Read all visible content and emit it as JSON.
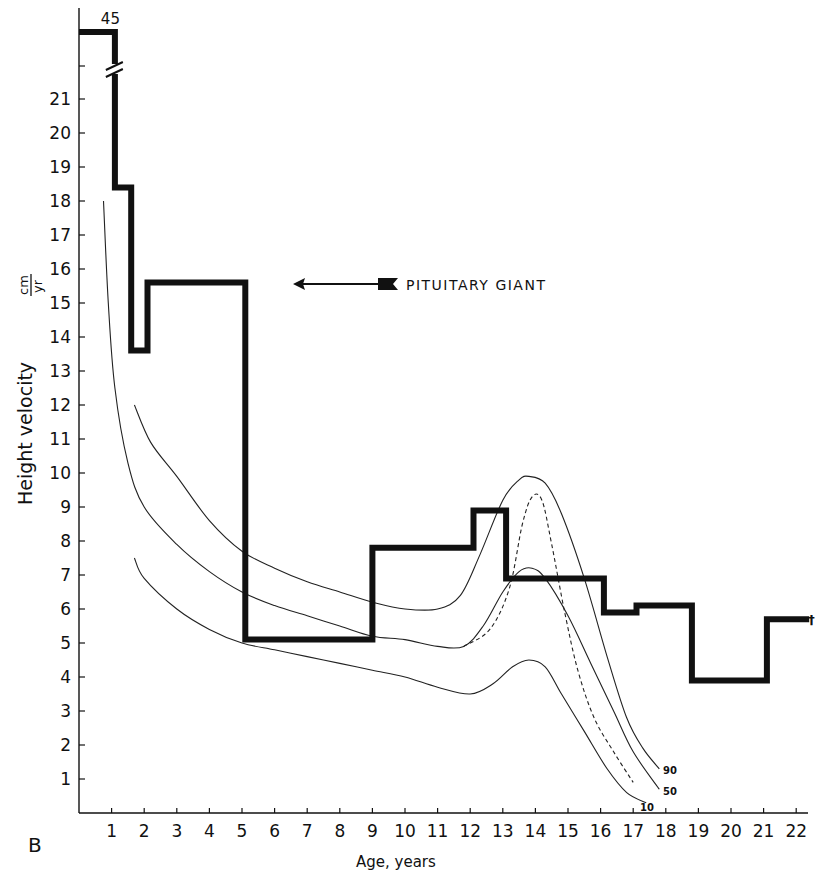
{
  "chart_data": {
    "type": "line",
    "title": "",
    "panel_label": "B",
    "xlabel": "Age, years",
    "ylabel": "Height velocity",
    "ylabel_unit": "cm/yr",
    "xlim": [
      0,
      22.7
    ],
    "ylim": [
      0,
      22
    ],
    "x_ticks": [
      1,
      2,
      3,
      4,
      5,
      6,
      7,
      8,
      9,
      10,
      11,
      12,
      13,
      14,
      15,
      16,
      17,
      18,
      19,
      20,
      21,
      22
    ],
    "y_ticks": [
      1,
      2,
      3,
      4,
      5,
      6,
      7,
      8,
      9,
      10,
      11,
      12,
      13,
      14,
      15,
      16,
      17,
      18,
      19,
      20,
      21
    ],
    "axis_break": {
      "label": "45",
      "value": 45,
      "note": "y-axis break; first interval off-scale at 45 cm/yr"
    },
    "grid": false,
    "legend": {
      "entries": [
        "PITUITARY GIANT"
      ],
      "position": "upper-center, arrow pointing left"
    },
    "series": [
      {
        "name": "PITUITARY GIANT",
        "style": "thick step",
        "steps": [
          {
            "from": 0.0,
            "to": 1.1,
            "value": 45
          },
          {
            "from": 1.1,
            "to": 1.6,
            "value": 18.4
          },
          {
            "from": 1.6,
            "to": 2.1,
            "value": 13.6
          },
          {
            "from": 2.1,
            "to": 5.1,
            "value": 15.6
          },
          {
            "from": 5.1,
            "to": 9.0,
            "value": 5.1
          },
          {
            "from": 9.0,
            "to": 12.1,
            "value": 7.8
          },
          {
            "from": 12.1,
            "to": 13.1,
            "value": 8.9
          },
          {
            "from": 13.1,
            "to": 16.1,
            "value": 6.9
          },
          {
            "from": 16.1,
            "to": 17.1,
            "value": 5.9
          },
          {
            "from": 17.1,
            "to": 18.8,
            "value": 6.1
          },
          {
            "from": 18.8,
            "to": 21.1,
            "value": 3.9
          },
          {
            "from": 21.1,
            "to": 22.4,
            "value": 5.7
          }
        ],
        "end_marker": "†"
      },
      {
        "name": "90th centile",
        "label": "90",
        "style": "thin solid",
        "points": [
          [
            1.7,
            12.0
          ],
          [
            2.2,
            10.9
          ],
          [
            3,
            9.9
          ],
          [
            4,
            8.6
          ],
          [
            5,
            7.7
          ],
          [
            6,
            7.2
          ],
          [
            7,
            6.8
          ],
          [
            8,
            6.5
          ],
          [
            9,
            6.2
          ],
          [
            10,
            6.0
          ],
          [
            11,
            6.0
          ],
          [
            11.7,
            6.4
          ],
          [
            12.3,
            7.6
          ],
          [
            13,
            9.2
          ],
          [
            13.5,
            9.8
          ],
          [
            13.8,
            9.9
          ],
          [
            14.3,
            9.7
          ],
          [
            14.8,
            8.8
          ],
          [
            15.5,
            6.9
          ],
          [
            16.2,
            4.6
          ],
          [
            16.8,
            2.8
          ],
          [
            17.3,
            1.9
          ],
          [
            17.8,
            1.3
          ]
        ]
      },
      {
        "name": "50th centile",
        "label": "50",
        "style": "thin solid",
        "points": [
          [
            0.75,
            18.0
          ],
          [
            0.9,
            15.0
          ],
          [
            1.1,
            12.5
          ],
          [
            1.5,
            10.3
          ],
          [
            2,
            9.0
          ],
          [
            3,
            7.9
          ],
          [
            4,
            7.1
          ],
          [
            5,
            6.5
          ],
          [
            6,
            6.1
          ],
          [
            7,
            5.8
          ],
          [
            8,
            5.5
          ],
          [
            9,
            5.2
          ],
          [
            10,
            5.1
          ],
          [
            11,
            4.9
          ],
          [
            11.8,
            4.9
          ],
          [
            12.4,
            5.5
          ],
          [
            13,
            6.5
          ],
          [
            13.5,
            7.1
          ],
          [
            13.9,
            7.2
          ],
          [
            14.3,
            6.9
          ],
          [
            15,
            5.8
          ],
          [
            15.7,
            4.4
          ],
          [
            16.4,
            3.0
          ],
          [
            17,
            1.8
          ],
          [
            17.8,
            0.7
          ]
        ]
      },
      {
        "name": "Peak-aligned mean (dashed)",
        "style": "thin dashed",
        "points": [
          [
            11.8,
            4.9
          ],
          [
            12.6,
            5.4
          ],
          [
            13.2,
            6.6
          ],
          [
            13.6,
            8.5
          ],
          [
            13.9,
            9.3
          ],
          [
            14.2,
            9.2
          ],
          [
            14.5,
            7.9
          ],
          [
            14.9,
            5.9
          ],
          [
            15.3,
            4.2
          ],
          [
            15.8,
            2.8
          ],
          [
            16.4,
            1.8
          ],
          [
            17.0,
            0.9
          ]
        ]
      },
      {
        "name": "10th centile",
        "label": "10",
        "style": "thin solid",
        "points": [
          [
            1.7,
            7.5
          ],
          [
            2,
            6.9
          ],
          [
            3,
            6.0
          ],
          [
            4,
            5.4
          ],
          [
            5,
            5.0
          ],
          [
            6,
            4.8
          ],
          [
            7,
            4.6
          ],
          [
            8,
            4.4
          ],
          [
            9,
            4.2
          ],
          [
            10,
            4.0
          ],
          [
            11,
            3.7
          ],
          [
            12,
            3.5
          ],
          [
            12.7,
            3.8
          ],
          [
            13.3,
            4.3
          ],
          [
            13.8,
            4.5
          ],
          [
            14.3,
            4.3
          ],
          [
            14.8,
            3.5
          ],
          [
            15.5,
            2.4
          ],
          [
            16.2,
            1.3
          ],
          [
            16.8,
            0.6
          ],
          [
            17.4,
            0.3
          ]
        ]
      }
    ]
  },
  "labels": {
    "panel": "B",
    "x_title": "Age, years",
    "y_title": "Height velocity",
    "y_unit_num": "cm",
    "y_unit_den": "yr",
    "break_value": "45",
    "legend": "PITUITARY GIANT",
    "pct90": "90",
    "pct50": "50",
    "pct10": "10",
    "dagger": "†"
  },
  "colors": {
    "ink": "#111111",
    "background": "#ffffff"
  }
}
